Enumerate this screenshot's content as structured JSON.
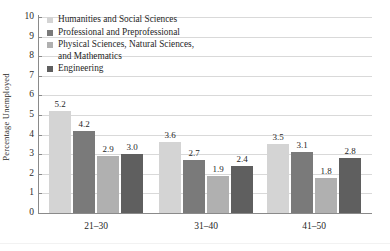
{
  "chart_data": {
    "type": "bar",
    "title": "",
    "subtitle": "",
    "xlabel": "",
    "ylabel": "Percentage Unemployed",
    "categories": [
      "21–30",
      "31–40",
      "41–50"
    ],
    "ylim": [
      0,
      10
    ],
    "ytick_labels": [
      "0",
      "1",
      "2",
      "3",
      "4",
      "5",
      "6",
      "7",
      "8",
      "9",
      "10"
    ],
    "grid": true,
    "legend_position": "top-left-inside",
    "series": [
      {
        "name": "Humanities and Social Sciences",
        "color": "#d4d4d4",
        "values": [
          5.2,
          3.6,
          3.5
        ],
        "labels": [
          "5.2",
          "3.6",
          "3.5"
        ]
      },
      {
        "name": "Professional and Preprofessional",
        "color": "#7a7a7a",
        "values": [
          4.2,
          2.7,
          3.1
        ],
        "labels": [
          "4.2",
          "2.7",
          "3.1"
        ]
      },
      {
        "name": "Physical Sciences, Natural Sciences,\nand Mathematics",
        "color": "#b0b0b0",
        "values": [
          2.9,
          1.9,
          1.8
        ],
        "labels": [
          "2.9",
          "1.9",
          "1.8"
        ]
      },
      {
        "name": "Engineering",
        "color": "#5f5f5f",
        "values": [
          3.0,
          2.4,
          2.8
        ],
        "labels": [
          "3.0",
          "2.4",
          "2.8"
        ]
      }
    ]
  },
  "axis": {
    "y_title": "Percentage Unemployed"
  },
  "colors": {
    "gridline": "#d9d9d9",
    "axis": "#8a8a8a",
    "text": "#1f1f1f",
    "background": "#ffffff"
  }
}
